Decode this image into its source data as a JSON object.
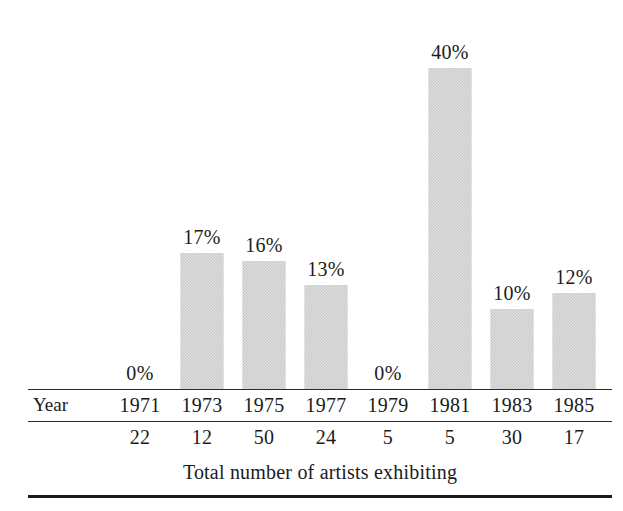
{
  "chart_data": {
    "type": "bar",
    "title": "",
    "subtitle": "",
    "xlabel": "Year",
    "ylabel": "",
    "categories": [
      "1971",
      "1973",
      "1975",
      "1977",
      "1979",
      "1981",
      "1983",
      "1985"
    ],
    "values": [
      0,
      17,
      16,
      13,
      0,
      40,
      10,
      12
    ],
    "value_labels": [
      "0%",
      "17%",
      "16%",
      "13%",
      "0%",
      "40%",
      "10%",
      "12%"
    ],
    "ylim": [
      0,
      40
    ],
    "grid": false,
    "legend": null,
    "series": [
      {
        "name": "Percent",
        "values": [
          0,
          17,
          16,
          13,
          0,
          40,
          10,
          12
        ]
      },
      {
        "name": "Total number of artists exhibiting",
        "values": [
          22,
          12,
          50,
          24,
          5,
          5,
          30,
          17
        ]
      }
    ],
    "annotations": [
      "Total number of artists exhibiting"
    ]
  },
  "table": {
    "year_row_label": "Year",
    "years": [
      "1971",
      "1973",
      "1975",
      "1977",
      "1979",
      "1981",
      "1983",
      "1985"
    ],
    "totals_row_label": "",
    "totals": [
      "22",
      "12",
      "50",
      "24",
      "5",
      "5",
      "30",
      "17"
    ],
    "caption": "Total number of artists exhibiting"
  },
  "bars": [
    {
      "label": "0%",
      "value": 0
    },
    {
      "label": "17%",
      "value": 17
    },
    {
      "label": "16%",
      "value": 16
    },
    {
      "label": "13%",
      "value": 13
    },
    {
      "label": "0%",
      "value": 0
    },
    {
      "label": "40%",
      "value": 40
    },
    {
      "label": "10%",
      "value": 10
    },
    {
      "label": "12%",
      "value": 12
    }
  ],
  "colors": {
    "bar_fill": "#c9c9c9",
    "text": "#1b1b1b",
    "rule": "#2a2a2a",
    "background": "#ffffff"
  }
}
